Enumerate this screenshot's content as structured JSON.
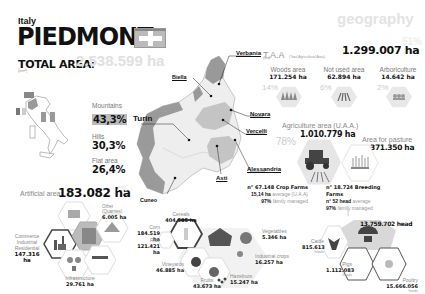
{
  "header": {
    "country": "Italy",
    "region": "PIEDMONT",
    "section": "geography",
    "total_area_label": "TOTAL AREA",
    "total_area_sub": "(km²)",
    "total_area_value": "2.538.599 ha"
  },
  "map": {
    "cities": [
      "Verbania",
      "Biella",
      "Turin",
      "Novara",
      "Vercelli",
      "Alessandria",
      "Asti",
      "Cuneo"
    ]
  },
  "terrain": [
    {
      "label": "Mountains",
      "value": "43,3%"
    },
    {
      "label": "Hills",
      "value": "30,3%"
    },
    {
      "label": "Flat area",
      "value": "26,4%"
    }
  ],
  "taa": {
    "label": "T.A.A",
    "sub": "(Total Agricultural Area)",
    "sub2": "(ha)",
    "value": "1.299.007 ha",
    "ghost_pct": "51%"
  },
  "land_use": [
    {
      "label": "Woods area",
      "value": "171.254 ha",
      "pct": "14%",
      "icon": "trees-icon"
    },
    {
      "label": "Not used area",
      "value": "62.894 ha",
      "pct": "6%",
      "icon": "fields-icon"
    },
    {
      "label": "Arboriculture",
      "value": "14.642 ha",
      "pct": "2%",
      "icon": "orchard-icon"
    }
  ],
  "uaa": {
    "label": "Agriculture area (U.A.A.)",
    "value": "1.010.779 ha",
    "pct": "78%"
  },
  "pasture": {
    "label": "Area for pasture",
    "value": "371.350 ha"
  },
  "crop_farms": {
    "line1": "n° 67.148 Crop Farms",
    "line2_bold": "15,14 ha",
    "line2_rest": "average (U.A.A)",
    "line3_bold": "97%",
    "line3_rest": "family managed"
  },
  "breeding_farms": {
    "line1": "n° 18.724 Breeding Farms",
    "line2_bold": "n° 52 head",
    "line2_rest": "average",
    "line3_bold": "97%",
    "line3_rest": "family managed"
  },
  "artificial": {
    "label": "Artificial area:",
    "value": "183.082 ha",
    "ghost_pct": "7%",
    "items": [
      {
        "label": "Other (Quarries)",
        "value": "6.005 ha"
      },
      {
        "label": "Commerce Industrial Residential",
        "value": "147.316 ha"
      },
      {
        "label": "Infrastructure",
        "value": "29.761 ha"
      }
    ]
  },
  "crops": [
    {
      "label": "Cereals",
      "value": "404.585 ha"
    },
    {
      "label": "Corn",
      "value": "184.519 ha"
    },
    {
      "label": "Rice",
      "value": "121.421 ha"
    },
    {
      "label": "Vineyards",
      "value": "46.885 ha"
    },
    {
      "label": "Fruits",
      "value": "43.673 ha"
    },
    {
      "label": "Hazelnuts",
      "value": "15.247 ha"
    },
    {
      "label": "Vegetables",
      "value": "5.346 ha"
    },
    {
      "label": "Industrial crops",
      "value": "16.257 ha"
    }
  ],
  "livestock": {
    "total": "13.759.702 head",
    "items": [
      {
        "label": "Cattle",
        "value": "815.613",
        "unit": "heads"
      },
      {
        "label": "Pigs",
        "value": "1.112.083",
        "unit": "heads"
      },
      {
        "label": "Poultry",
        "value": "15.666.056",
        "unit": "heads"
      }
    ]
  }
}
